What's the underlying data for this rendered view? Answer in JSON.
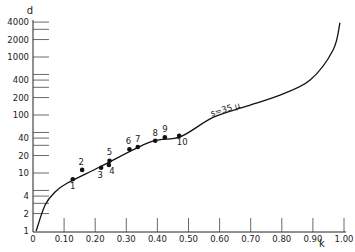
{
  "chart_data": {
    "type": "line",
    "title": "",
    "xlabel": "k",
    "ylabel": "d",
    "xscale": "linear",
    "yscale": "log",
    "xlim": [
      0,
      1.0
    ],
    "ylim": [
      1,
      4000
    ],
    "grid": false,
    "x_ticks": [
      {
        "value": 0,
        "label": "0"
      },
      {
        "value": 0.1,
        "label": "0.10"
      },
      {
        "value": 0.2,
        "label": "0.20"
      },
      {
        "value": 0.3,
        "label": "0.30"
      },
      {
        "value": 0.4,
        "label": "0.40"
      },
      {
        "value": 0.5,
        "label": "0.50"
      },
      {
        "value": 0.6,
        "label": "0.60"
      },
      {
        "value": 0.7,
        "label": "0.70"
      },
      {
        "value": 0.8,
        "label": "0.80"
      },
      {
        "value": 0.9,
        "label": "0.90"
      },
      {
        "value": 1.0,
        "label": "1.00"
      }
    ],
    "y_ticks": [
      {
        "value": 1,
        "label": "1"
      },
      {
        "value": 2,
        "label": "2"
      },
      {
        "value": 3,
        "label": ""
      },
      {
        "value": 4,
        "label": "4"
      },
      {
        "value": 5,
        "label": ""
      },
      {
        "value": 10,
        "label": "10"
      },
      {
        "value": 20,
        "label": "20"
      },
      {
        "value": 30,
        "label": ""
      },
      {
        "value": 40,
        "label": "40"
      },
      {
        "value": 50,
        "label": ""
      },
      {
        "value": 100,
        "label": "100"
      },
      {
        "value": 200,
        "label": "200"
      },
      {
        "value": 300,
        "label": ""
      },
      {
        "value": 400,
        "label": "400"
      },
      {
        "value": 500,
        "label": ""
      },
      {
        "value": 1000,
        "label": "1000"
      },
      {
        "value": 2000,
        "label": "2000"
      },
      {
        "value": 3000,
        "label": ""
      },
      {
        "value": 4000,
        "label": "4000"
      }
    ],
    "series": [
      {
        "name": "s = 35 μ",
        "kind": "curve",
        "annotation": "s=35 μ",
        "points": [
          {
            "k": 0.01,
            "d": 1.0
          },
          {
            "k": 0.039,
            "d": 2.8
          },
          {
            "k": 0.071,
            "d": 4.7
          },
          {
            "k": 0.108,
            "d": 6.6
          },
          {
            "k": 0.215,
            "d": 12.7
          },
          {
            "k": 0.376,
            "d": 34
          },
          {
            "k": 0.473,
            "d": 42
          },
          {
            "k": 0.579,
            "d": 91
          },
          {
            "k": 0.687,
            "d": 142
          },
          {
            "k": 0.794,
            "d": 220
          },
          {
            "k": 0.891,
            "d": 400
          },
          {
            "k": 0.965,
            "d": 1320
          },
          {
            "k": 0.987,
            "d": 3900
          }
        ]
      },
      {
        "name": "measured",
        "kind": "scatter",
        "points": [
          {
            "id": "1",
            "k": 0.128,
            "d": 7.8
          },
          {
            "id": "2",
            "k": 0.158,
            "d": 11.3
          },
          {
            "id": "3",
            "k": 0.219,
            "d": 12.3
          },
          {
            "id": "4",
            "k": 0.244,
            "d": 13.7
          },
          {
            "id": "5",
            "k": 0.246,
            "d": 16.3
          },
          {
            "id": "6",
            "k": 0.31,
            "d": 25.6
          },
          {
            "id": "7",
            "k": 0.337,
            "d": 28.1
          },
          {
            "id": "8",
            "k": 0.393,
            "d": 36.0
          },
          {
            "id": "9",
            "k": 0.424,
            "d": 41.3
          },
          {
            "id": "10",
            "k": 0.47,
            "d": 44.0
          }
        ]
      }
    ]
  },
  "labels": {
    "y_axis": "d",
    "x_axis": "k",
    "curve_annotation": "s=35 μ"
  }
}
